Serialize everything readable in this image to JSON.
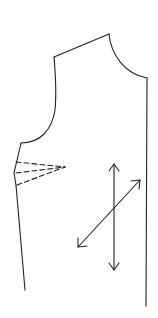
{
  "diagram": {
    "type": "sewing-pattern-bodice-front",
    "colors": {
      "background": "#ffffff",
      "stroke": "#222222"
    },
    "outline": {
      "shoulder": {
        "from": [
          54,
          57
        ],
        "to": [
          109,
          34
        ]
      },
      "neckline": {
        "from": [
          109,
          34
        ],
        "to": [
          147,
          78
        ]
      },
      "center_front": {
        "from": [
          147,
          78
        ],
        "to": [
          146,
          306
        ]
      },
      "armhole": {
        "from": [
          54,
          57
        ],
        "to": [
          21,
          143
        ]
      },
      "side_seam": {
        "from": [
          21,
          143
        ],
        "to": [
          25,
          290
        ]
      }
    },
    "bust_dart": {
      "tip": [
        65,
        167
      ],
      "legs": [
        [
          14,
          162
        ],
        [
          14,
          173
        ],
        [
          16,
          185
        ]
      ],
      "style": "dashed"
    },
    "grainlines": [
      {
        "name": "straight-grain",
        "from": [
          114,
          164
        ],
        "to": [
          114,
          270
        ],
        "double_headed": true
      },
      {
        "name": "bias-grain",
        "from": [
          78,
          247
        ],
        "to": [
          140,
          180
        ],
        "double_headed": true
      }
    ]
  }
}
